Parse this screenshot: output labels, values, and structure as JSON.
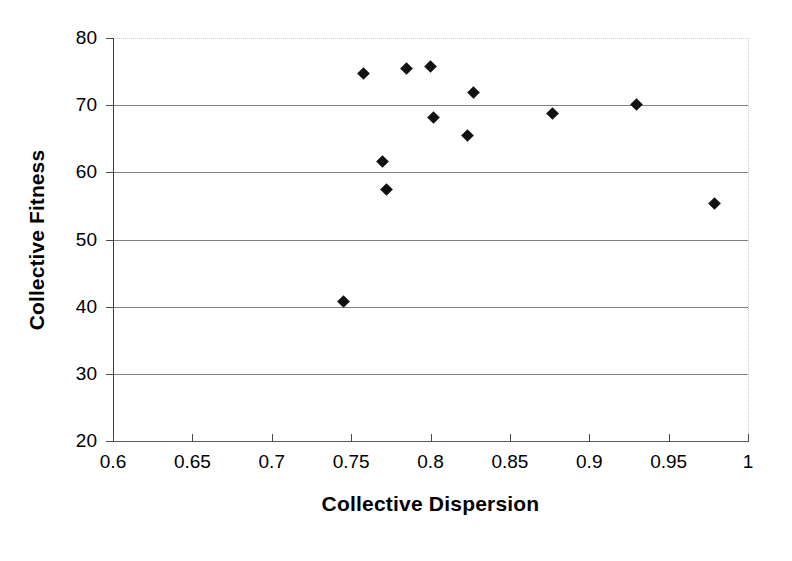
{
  "chart_data": {
    "type": "scatter",
    "title": "",
    "xlabel": "Collective Dispersion",
    "ylabel": "Collective Fitness",
    "xlim": [
      0.6,
      1.0
    ],
    "ylim": [
      20,
      80
    ],
    "xticks": [
      0.6,
      0.65,
      0.7,
      0.75,
      0.8,
      0.85,
      0.9,
      0.95,
      1
    ],
    "xtick_labels": [
      "0.6",
      "0.65",
      "0.7",
      "0.75",
      "0.8",
      "0.85",
      "0.9",
      "0.95",
      "1"
    ],
    "yticks": [
      20,
      30,
      40,
      50,
      60,
      70,
      80
    ],
    "ytick_labels": [
      "20",
      "30",
      "40",
      "50",
      "60",
      "70",
      "80"
    ],
    "grid": "horizontal",
    "legend": "none",
    "marker": "diamond",
    "marker_color": "#111111",
    "series": [
      {
        "name": "Collective Fitness vs Collective Dispersion",
        "points": [
          {
            "x": 0.745,
            "y": 40.7
          },
          {
            "x": 0.758,
            "y": 74.7
          },
          {
            "x": 0.77,
            "y": 61.6
          },
          {
            "x": 0.772,
            "y": 57.5
          },
          {
            "x": 0.785,
            "y": 75.4
          },
          {
            "x": 0.8,
            "y": 75.8
          },
          {
            "x": 0.802,
            "y": 68.2
          },
          {
            "x": 0.823,
            "y": 65.5
          },
          {
            "x": 0.827,
            "y": 71.9
          },
          {
            "x": 0.877,
            "y": 68.7
          },
          {
            "x": 0.93,
            "y": 70.1
          },
          {
            "x": 0.979,
            "y": 55.4
          }
        ]
      }
    ]
  }
}
